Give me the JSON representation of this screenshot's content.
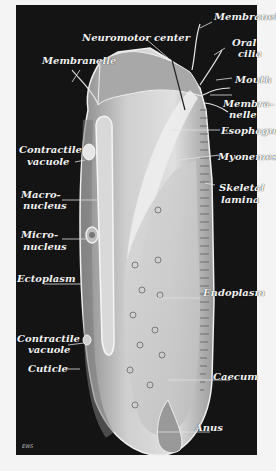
{
  "diagram": {
    "background_color": "#141414",
    "label_color": "#f2f2f2",
    "labels": {
      "membranelle_top": "Membranelle",
      "neuromotor_center": "Neuromotor center",
      "membranelle_left": "Membranelle",
      "oral_cilia_1": "Oral",
      "oral_cilia_2": "cilia",
      "mouth": "Mouth",
      "membranelle_right_1": "Membra-",
      "membranelle_right_2": "nelle",
      "esophagus": "Esophagus",
      "contractile_vacuole_top_1": "Contractile",
      "contractile_vacuole_top_2": "vacuole",
      "myonemes": "Myonemes",
      "skeletal_lamina_1": "Skeletal",
      "skeletal_lamina_2": "lamina",
      "macronucleus_1": "Macro-",
      "macronucleus_2": "nucleus",
      "micronucleus_1": "Micro-",
      "micronucleus_2": "nucleus",
      "ectoplasm": "Ectoplasm",
      "endoplasm": "Endoplasm",
      "contractile_vacuole_bottom_1": "Contractile",
      "contractile_vacuole_bottom_2": "vacuole",
      "cuticle": "Cuticle",
      "caecum": "Caecum",
      "anus": "Anus"
    },
    "signature": "EWS"
  }
}
